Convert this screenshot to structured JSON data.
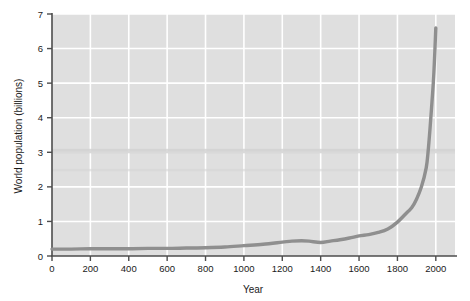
{
  "figure": {
    "background_color": "#ffffff",
    "plot_background_color": "#dfdfdf",
    "gridline_color": "#ffffff",
    "axis_color": "#4d4d4d",
    "line_color": "#8f8f8f",
    "tick_label_color": "#1a1a1a"
  },
  "chart_data": {
    "type": "line",
    "title": "",
    "subtitle": "",
    "xlabel": "Year",
    "ylabel": "World population (billions)",
    "xlim": [
      0,
      2100
    ],
    "ylim": [
      0,
      7
    ],
    "xticks": [
      0,
      200,
      400,
      600,
      800,
      1000,
      1200,
      1400,
      1600,
      1800,
      2000
    ],
    "yticks": [
      0,
      1,
      2,
      3,
      4,
      5,
      6,
      7
    ],
    "xtick_labels": [
      "0",
      "200",
      "400",
      "600",
      "800",
      "1000",
      "1200",
      "1400",
      "1600",
      "1800",
      "2000"
    ],
    "ytick_labels": [
      "0",
      "1",
      "2",
      "3",
      "4",
      "5",
      "6",
      "7"
    ],
    "grid": true,
    "grid_axes": "both",
    "legend": false,
    "legend_position": "none",
    "series": [
      {
        "name": "World population",
        "x": [
          0,
          100,
          200,
          300,
          400,
          500,
          600,
          700,
          800,
          900,
          1000,
          1100,
          1200,
          1250,
          1300,
          1340,
          1400,
          1450,
          1500,
          1550,
          1600,
          1650,
          1700,
          1750,
          1800,
          1850,
          1875,
          1900,
          1925,
          1950,
          1960,
          1970,
          1980,
          1990,
          2000
        ],
        "y": [
          0.2,
          0.2,
          0.21,
          0.21,
          0.21,
          0.22,
          0.22,
          0.23,
          0.24,
          0.26,
          0.3,
          0.34,
          0.4,
          0.43,
          0.44,
          0.43,
          0.39,
          0.43,
          0.47,
          0.52,
          0.58,
          0.62,
          0.68,
          0.78,
          0.98,
          1.26,
          1.4,
          1.65,
          2.0,
          2.55,
          3.03,
          3.7,
          4.45,
          5.3,
          6.6
        ]
      }
    ]
  },
  "axis_labels": {
    "x_axis_title": "Year",
    "y_axis_title": "World population (billions)"
  }
}
